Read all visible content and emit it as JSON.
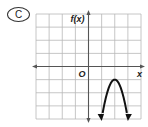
{
  "choice_label": "C",
  "chart_data": {
    "type": "line",
    "title": "",
    "xlabel": "x",
    "ylabel": "f(x)",
    "origin_label": "O",
    "xlim": [
      -4,
      4
    ],
    "ylim": [
      -4,
      4
    ],
    "grid": true,
    "grid_step": 1,
    "series": [
      {
        "name": "f(x)",
        "shape": "downward-opening parabola",
        "vertex": [
          2,
          -1
        ],
        "x": [
          1,
          1.5,
          2,
          2.5,
          3
        ],
        "y": [
          -4,
          -1.75,
          -1,
          -1.75,
          -4
        ],
        "end_arrows": true
      }
    ]
  }
}
